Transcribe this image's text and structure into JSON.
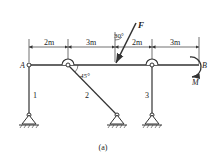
{
  "figure": {
    "caption": "(a)",
    "labels": {
      "A": "A",
      "B": "B",
      "F": "F",
      "M": "M",
      "bar1": "1",
      "bar2": "2",
      "bar3": "3",
      "angle_force": "30°",
      "angle_bar2": "45°"
    },
    "dimensions": [
      "2m",
      "3m",
      "2m",
      "3m"
    ],
    "colors": {
      "stroke": "#333333",
      "background": "#ffffff"
    }
  }
}
